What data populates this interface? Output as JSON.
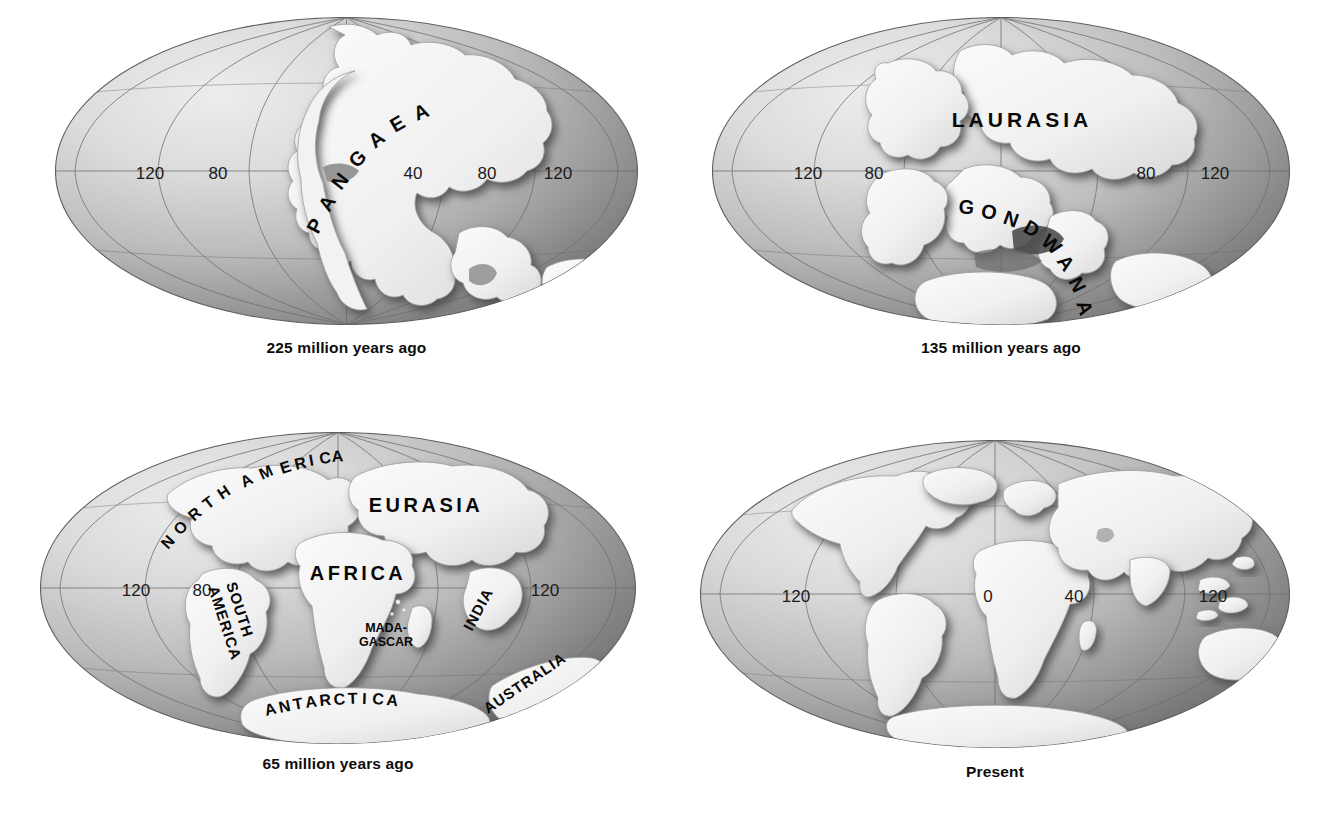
{
  "figure": {
    "type": "map-diagram",
    "background": "#ffffff",
    "ink": "#0d0d0d"
  },
  "colors": {
    "ocean_light": "#e2e2e2",
    "ocean_mid": "#b4b4b4",
    "ocean_dark": "#6e6e6e",
    "land_light": "#f4f4f4",
    "land_shadow": "#8a8a8a",
    "graticule": "#6b6b6b",
    "label": "#080808"
  },
  "panels": [
    {
      "id": "panel-225",
      "caption": "225 million years ago",
      "ticks": [
        {
          "label": "120",
          "x": -120
        },
        {
          "label": "80",
          "x": -80
        },
        {
          "label": "40",
          "x": 40
        },
        {
          "label": "80",
          "x": 80
        },
        {
          "label": "120",
          "x": 120
        }
      ],
      "labels": [
        {
          "text": "PANGAEA",
          "style": "arc"
        }
      ]
    },
    {
      "id": "panel-135",
      "caption": "135 million years ago",
      "ticks": [
        {
          "label": "120",
          "x": -120
        },
        {
          "label": "80",
          "x": -80
        },
        {
          "label": "80",
          "x": 80
        },
        {
          "label": "120",
          "x": 120
        }
      ],
      "labels": [
        {
          "text": "LAURASIA",
          "style": "straight"
        },
        {
          "text": "GONDWANA",
          "style": "arc"
        }
      ]
    },
    {
      "id": "panel-65",
      "caption": "65 million years ago",
      "ticks": [
        {
          "label": "120",
          "x": -120
        },
        {
          "label": "80",
          "x": -80
        },
        {
          "label": "120",
          "x": 120
        }
      ],
      "labels": [
        {
          "text": "NORTH AMERICA",
          "style": "arc"
        },
        {
          "text": "EURASIA",
          "style": "straight"
        },
        {
          "text": "AFRICA",
          "style": "straight"
        },
        {
          "text": "SOUTH",
          "style": "rotated"
        },
        {
          "text": "AMERICA",
          "style": "rotated"
        },
        {
          "text": "INDIA",
          "style": "rotated"
        },
        {
          "text": "MADA-",
          "style": "straight"
        },
        {
          "text": "GASCAR",
          "style": "straight"
        },
        {
          "text": "ANTARCTICA",
          "style": "arc"
        },
        {
          "text": "AUSTRALIA",
          "style": "rotated"
        }
      ]
    },
    {
      "id": "panel-present",
      "caption": "Present",
      "ticks": [
        {
          "label": "120",
          "x": -120
        },
        {
          "label": "0",
          "x": 0
        },
        {
          "label": "40",
          "x": 40
        },
        {
          "label": "120",
          "x": 120
        }
      ],
      "labels": []
    }
  ],
  "p1": {
    "caption": "225 million years ago",
    "t1": "120",
    "t2": "80",
    "t3": "40",
    "t4": "80",
    "t5": "120",
    "pangaea": "PANGAEA",
    "arc_chars": [
      "P",
      "A",
      "N",
      "G",
      "A",
      "E",
      "A"
    ]
  },
  "p2": {
    "caption": "135 million years ago",
    "t1": "120",
    "t2": "80",
    "t3": "80",
    "t4": "120",
    "laurasia": "LAURASIA",
    "gondwana": "GONDWANA",
    "gond_chars": [
      "G",
      "O",
      "N",
      "D",
      "W",
      "A",
      "N",
      "A"
    ]
  },
  "p3": {
    "caption": "65 million years ago",
    "t1": "120",
    "t2": "80",
    "t3": "120",
    "north_america": "NORTH AMERICA",
    "eurasia": "EURASIA",
    "africa": "AFRICA",
    "south": "SOUTH",
    "america": "AMERICA",
    "india": "INDIA",
    "mada": "MADA-",
    "gascar": "GASCAR",
    "antarctica": "ANTARCTICA",
    "australia": "AUSTRALIA",
    "na_chars": [
      "N",
      "O",
      "R",
      "T",
      "H",
      " ",
      "A",
      "M",
      "E",
      "R",
      "I",
      "C",
      "A"
    ],
    "ant_chars": [
      "A",
      "N",
      "T",
      "A",
      "R",
      "C",
      "T",
      "I",
      "C",
      "A"
    ]
  },
  "p4": {
    "caption": "Present",
    "t1": "120",
    "t2": "0",
    "t3": "40",
    "t4": "120"
  }
}
